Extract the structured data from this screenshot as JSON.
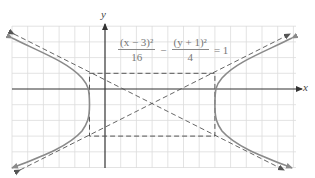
{
  "figure": {
    "equation": {
      "term1_numerator": "(x − 3)²",
      "term1_denominator": "16",
      "operator": "−",
      "term2_numerator": "(y + 1)²",
      "term2_denominator": "4",
      "rhs": "= 1"
    },
    "axes": {
      "x_label": "x",
      "y_label": "y"
    },
    "hyperbola": {
      "center": [
        3,
        -1
      ],
      "a": 4,
      "b": 2,
      "orientation": "horizontal",
      "vertices": [
        [
          -1,
          -1
        ],
        [
          7,
          -1
        ]
      ],
      "asymptotes": [
        "y + 1 = (1/2)(x − 3)",
        "y + 1 = −(1/2)(x − 3)"
      ],
      "fundamental_rectangle": {
        "x_range": [
          -1,
          7
        ],
        "y_range": [
          -3,
          1
        ]
      }
    },
    "grid": {
      "unit_px": 15.7,
      "origin_px": [
        105,
        89
      ],
      "x_range": [
        -6,
        12
      ],
      "y_range": [
        -5,
        4
      ]
    },
    "colors": {
      "grid": "#dcdcdc",
      "axis": "#333333",
      "curve": "#8a8a8a",
      "dashed": "#555555",
      "equation_text": "#777777"
    }
  }
}
